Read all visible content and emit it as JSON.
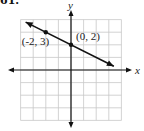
{
  "problem_number": "61.",
  "colors": {
    "grid": "#c8c8c8",
    "axis": "#111111",
    "line": "#111111",
    "text": "#222222"
  },
  "chart_data": {
    "type": "line",
    "title": "",
    "xlabel": "x",
    "ylabel": "y",
    "xlim": [
      -4,
      4
    ],
    "ylim": [
      -4,
      4
    ],
    "grid": true,
    "grid_step": 1,
    "tick_labels_shown": false,
    "series": [
      {
        "name": "line",
        "equation": "y = -1/2 x + 2",
        "slope": -0.5,
        "intercept": 2,
        "arrows_both_ends": true,
        "x_range_drawn": [
          -3.6,
          3.4
        ],
        "points": [
          {
            "x": -2,
            "y": 3,
            "label": "(-2, 3)"
          },
          {
            "x": 0,
            "y": 2,
            "label": "(0, 2)"
          }
        ]
      }
    ],
    "annotations": [
      "(-2, 3)",
      "(0, 2)"
    ]
  }
}
